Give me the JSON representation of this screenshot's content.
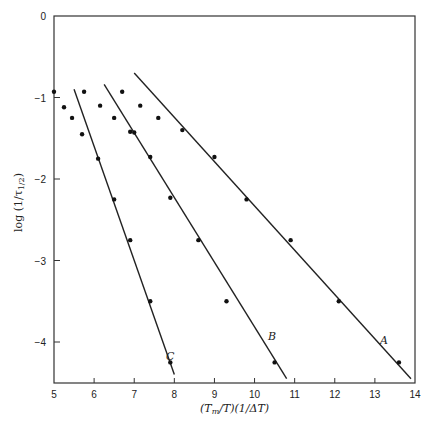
{
  "chart_data": {
    "type": "scatter",
    "title": "",
    "xlabel": "(T_m/T)(1/ΔT)",
    "ylabel": "log (1/τ_1/2)",
    "xlim": [
      5,
      14
    ],
    "ylim": [
      -4.5,
      0
    ],
    "grid": false,
    "x_ticks": [
      "5",
      "6",
      "7",
      "8",
      "9",
      "10",
      "11",
      "12",
      "13",
      "14"
    ],
    "y_ticks": [
      "0",
      "−1",
      "−2",
      "−3",
      "−4"
    ],
    "series": [
      {
        "name": "A",
        "type": "line",
        "x": [
          7.0,
          13.9
        ],
        "y": [
          -0.7,
          -4.45
        ],
        "points": {
          "x": [
            8.2,
            9.0,
            9.8,
            10.9,
            12.1,
            13.6
          ],
          "y": [
            -1.4,
            -1.73,
            -2.25,
            -2.75,
            -3.5,
            -4.25
          ]
        }
      },
      {
        "name": "B",
        "type": "line",
        "x": [
          6.25,
          10.8
        ],
        "y": [
          -0.84,
          -4.45
        ],
        "points": {
          "x": [
            7.0,
            7.4,
            7.9,
            8.6,
            10.5
          ],
          "y": [
            -1.43,
            -1.73,
            -2.23,
            -2.75,
            -4.25
          ]
        }
      },
      {
        "name": "C",
        "type": "line",
        "x": [
          5.5,
          8.0
        ],
        "y": [
          -0.9,
          -4.4
        ],
        "points": {
          "x": [
            6.1,
            6.5,
            6.9,
            7.4,
            7.9
          ],
          "y": [
            -1.75,
            -2.25,
            -2.75,
            -3.5,
            -4.25
          ]
        }
      },
      {
        "name": "scatter",
        "type": "scatter",
        "x": [
          5.0,
          5.25,
          5.45,
          5.7,
          5.75,
          6.15,
          6.5,
          6.9,
          6.7,
          7.15,
          7.6,
          9.3
        ],
        "y": [
          -0.93,
          -1.12,
          -1.25,
          -1.45,
          -0.93,
          -1.1,
          -1.25,
          -1.42,
          -0.93,
          -1.1,
          -1.25,
          -3.5
        ]
      }
    ],
    "annotations": [
      "A",
      "B",
      "C"
    ]
  },
  "labels": {
    "xlabel": "(T",
    "xlabel_sub": "m",
    "xlabel_rest": "/T)(1/ΔT)",
    "ylabel": "log (1/τ",
    "ylabel_sub": "1/2",
    "ylabel_end": ")",
    "line_a": "A",
    "line_b": "B",
    "line_c": "C"
  }
}
